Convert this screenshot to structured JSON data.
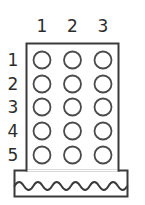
{
  "diagram": {
    "type": "connector-pinout",
    "column_headers": [
      "1",
      "2",
      "3"
    ],
    "row_labels": [
      "1",
      "2",
      "3",
      "4",
      "5"
    ],
    "grid": {
      "columns": 3,
      "rows": 5,
      "pin_count": 15,
      "pin_shape": "circle",
      "pin_fill": "none"
    },
    "body": {
      "shape": "rectangle",
      "fill": "none",
      "stroke": "#3a3a3a"
    },
    "base": {
      "shape": "rectangle",
      "fill": "none",
      "stroke": "#3a3a3a",
      "decoration": "wavy-line",
      "wave_count": 6
    },
    "colors": {
      "stroke": "#3a3a3a",
      "pin_stroke": "#4a4a4a",
      "text": "#2c2c2c",
      "background": "#ffffff"
    }
  }
}
